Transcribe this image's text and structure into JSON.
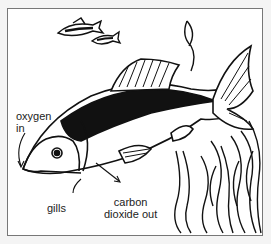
{
  "diagram": {
    "labels": {
      "oxygen_in_line1": "oxygen",
      "oxygen_in_line2": "in",
      "gills": "gills",
      "co2_line1": "carbon",
      "co2_line2": "dioxide out"
    },
    "colors": {
      "ink": "#111111",
      "background": "#ffffff",
      "frame": "#777777"
    }
  }
}
